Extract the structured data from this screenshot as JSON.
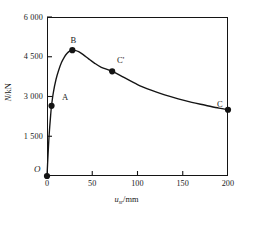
{
  "figure": {
    "caption": ""
  },
  "axes": {
    "y": {
      "title_symbol": "N",
      "title_sep": "/",
      "title_unit": "kN",
      "ticks": [
        "1 500",
        "3 000",
        "4 500",
        "6 000"
      ],
      "tick_values": [
        1500,
        3000,
        4500,
        6000
      ],
      "min": 0,
      "max": 6000
    },
    "x": {
      "title_symbol": "u",
      "title_subscript": "sr",
      "title_sep": "/",
      "title_unit": "mm",
      "ticks": [
        "0",
        "50",
        "100",
        "150",
        "200"
      ],
      "tick_values": [
        0,
        50,
        100,
        150,
        200
      ],
      "min": 0,
      "max": 200
    },
    "origin_label": "O"
  },
  "points": {
    "a": {
      "label": "A"
    },
    "b": {
      "label": "B"
    },
    "cprime": {
      "label": "C'"
    },
    "c": {
      "label": "C"
    }
  },
  "chart_data": {
    "type": "line",
    "title": "",
    "subtitle": "",
    "xlabel": "u_sr/mm",
    "ylabel": "N/kN",
    "xlim": [
      0,
      200
    ],
    "ylim": [
      0,
      6000
    ],
    "xticks": [
      0,
      50,
      100,
      150,
      200
    ],
    "yticks": [
      0,
      1500,
      3000,
      4500,
      6000
    ],
    "xtick_labels": [
      "0",
      "50",
      "100",
      "150",
      "200"
    ],
    "ytick_labels": [
      "0",
      "1 500",
      "3 000",
      "4 500",
      "6 000"
    ],
    "grid": false,
    "legend": null,
    "series": [
      {
        "name": "N-u curve",
        "x": [
          0,
          1,
          2,
          3,
          4,
          5,
          7,
          10,
          13,
          16,
          19,
          22,
          25,
          28,
          31,
          35,
          40,
          46,
          52,
          60,
          72,
          85,
          100,
          115,
          130,
          145,
          160,
          175,
          190,
          200
        ],
        "y": [
          0,
          700,
          1350,
          1850,
          2280,
          2650,
          3150,
          3650,
          4000,
          4280,
          4480,
          4620,
          4710,
          4750,
          4740,
          4690,
          4580,
          4420,
          4270,
          4100,
          3950,
          3720,
          3450,
          3240,
          3060,
          2910,
          2780,
          2670,
          2560,
          2500
        ]
      }
    ],
    "annotated_points": [
      {
        "label": "A",
        "x": 5,
        "y": 2650
      },
      {
        "label": "B",
        "x": 28,
        "y": 4750
      },
      {
        "label": "C'",
        "x": 72,
        "y": 3950
      },
      {
        "label": "C",
        "x": 200,
        "y": 2500
      },
      {
        "label": "O",
        "x": 0,
        "y": 0
      }
    ],
    "marker_style": "filled-circle",
    "line_color": "#141414"
  }
}
